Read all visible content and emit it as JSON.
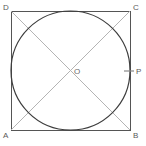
{
  "figure": {
    "kind": "geometry-diagram",
    "background_color": "#ffffff",
    "width": 146,
    "height": 146
  },
  "colors": {
    "square_stroke": "#555555",
    "circle_stroke": "#3d3d3d",
    "diagonal_stroke": "#b4b4b4",
    "tick_stroke": "#888888",
    "label_text": "#5a5a5a",
    "center_label_text": "#6a6a6a"
  },
  "square": {
    "name": "ABCD",
    "left": 11,
    "top": 11,
    "right": 130,
    "bottom": 130,
    "side_length": 119,
    "stroke_width": 1
  },
  "circle": {
    "name": "inscribed-circle",
    "center_x": 70.5,
    "center_y": 70.5,
    "radius": 59.5,
    "stroke_width": 1.2,
    "fill": "none",
    "inscribed": true
  },
  "diagonals": [
    {
      "name": "diagonal-AC",
      "x1": 11,
      "y1": 130,
      "x2": 130,
      "y2": 11
    },
    {
      "name": "diagonal-DB",
      "x1": 11,
      "y1": 11,
      "x2": 130,
      "y2": 130
    }
  ],
  "tick": {
    "name": "tangent-tick-P",
    "x1": 124,
    "y1": 71,
    "x2": 134,
    "y2": 71
  },
  "labels": {
    "top_left": "D",
    "top_right": "C",
    "bottom_left": "A",
    "bottom_right": "B",
    "center": "O",
    "tangent_point": "P"
  }
}
